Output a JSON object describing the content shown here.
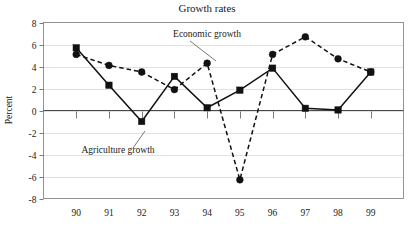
{
  "chart_data": {
    "type": "line",
    "title": "Growth rates",
    "xlabel": "",
    "ylabel": "Percent",
    "categories": [
      "90",
      "91",
      "92",
      "93",
      "94",
      "95",
      "96",
      "97",
      "98",
      "99"
    ],
    "ylim": [
      -8,
      8
    ],
    "ytick_labels": [
      "8",
      "6",
      "4",
      "2",
      "0",
      "-2",
      "-4",
      "-6",
      "-8"
    ],
    "ytick_values": [
      8,
      6,
      4,
      2,
      0,
      -2,
      -4,
      -6,
      -8
    ],
    "grid": true,
    "legend_position": "inline-annotations",
    "series": [
      {
        "name": "Agriculture growth",
        "marker": "square",
        "line": "solid",
        "values": [
          5.7,
          2.3,
          -1.0,
          3.1,
          0.25,
          1.85,
          3.85,
          0.2,
          0.05,
          3.5
        ]
      },
      {
        "name": "Economic growth",
        "marker": "circle",
        "line": "dashed",
        "values": [
          5.1,
          4.1,
          3.5,
          1.9,
          4.3,
          -6.3,
          5.1,
          6.7,
          4.7,
          3.5
        ]
      }
    ],
    "annotations": [
      {
        "text": "Economic growth",
        "target_series": "Economic growth",
        "target_category": "94"
      },
      {
        "text": "Agriculture growth",
        "target_series": "Agriculture growth",
        "target_category": "92"
      }
    ],
    "colors": {
      "line": "#111111",
      "grid": "#d9d9d9",
      "frame": "#888888",
      "zero_line": "#4a4a4a",
      "background": "#ffffff"
    }
  }
}
